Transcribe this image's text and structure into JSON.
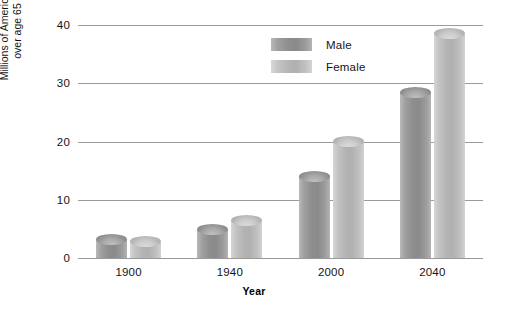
{
  "chart_data": {
    "type": "bar",
    "title": "",
    "subtitle": "",
    "xlabel": "Year",
    "ylabel_line1": "Millions of Americans",
    "ylabel_line2": "over age 65",
    "categories": [
      "1900",
      "1940",
      "2000",
      "2040"
    ],
    "series": [
      {
        "name": "Male",
        "values": [
          3.1,
          4.9,
          14.0,
          28.5
        ],
        "color": "#8a8a8a"
      },
      {
        "name": "Female",
        "values": [
          2.8,
          6.5,
          20.0,
          38.5
        ],
        "color": "#b0b0b0"
      }
    ],
    "ylim": [
      0,
      40
    ],
    "yticks": [
      0,
      10,
      20,
      30,
      40
    ],
    "ytick_labels": [
      "0",
      "10",
      "20",
      "30",
      "40"
    ],
    "grid": true,
    "legend_position": "top-center",
    "bar_style": "cylinder"
  },
  "legend": {
    "entries": [
      {
        "label": "Male"
      },
      {
        "label": "Female"
      }
    ]
  },
  "axes": {
    "y_title_line1": "Millions of Americans",
    "y_title_line2": "over age 65",
    "x_title": "Year"
  }
}
